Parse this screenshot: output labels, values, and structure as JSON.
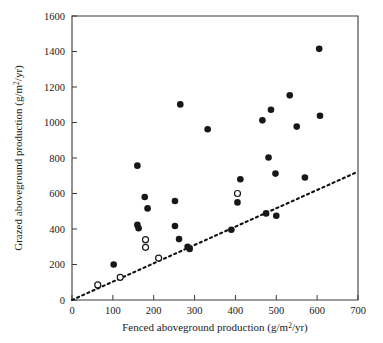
{
  "chart_data": {
    "type": "scatter",
    "title": "",
    "xlabel": "Fenced aboveground production (g/m2/yr)",
    "ylabel": "Grazed aboveground production (g/m2/yr)",
    "xlabel_parts": {
      "pre": "Fenced aboveground production (g/m",
      "sup": "2",
      "post": "/yr)"
    },
    "ylabel_parts": {
      "pre": "Grazed aboveground production (g/m",
      "sup": "2",
      "post": "/yr)"
    },
    "xlim": [
      0,
      700
    ],
    "ylim": [
      0,
      1600
    ],
    "xticks": [
      0,
      100,
      200,
      300,
      400,
      500,
      600,
      700
    ],
    "yticks": [
      0,
      200,
      400,
      600,
      800,
      1000,
      1200,
      1400,
      1600
    ],
    "xtick_labels": [
      "0",
      "100",
      "200",
      "300",
      "400",
      "500",
      "600",
      "700"
    ],
    "ytick_labels": [
      "0",
      "200",
      "400",
      "600",
      "800",
      "1000",
      "1200",
      "1400",
      "1600"
    ],
    "grid": false,
    "legend_position": "none",
    "annotations": [
      {
        "name": "one-to-one-reference-line",
        "type": "dashed-line",
        "description": "Dashed 1:1 reference line from origin",
        "x0": 0,
        "y0": 0,
        "x1": 695,
        "y1": 718
      }
    ],
    "series": [
      {
        "name": "filled",
        "marker": "filled-circle",
        "color": "#171717",
        "points": [
          [
            102,
            200
          ],
          [
            160,
            757
          ],
          [
            160,
            423
          ],
          [
            163,
            404
          ],
          [
            178,
            580
          ],
          [
            185,
            516
          ],
          [
            252,
            558
          ],
          [
            252,
            417
          ],
          [
            262,
            343
          ],
          [
            265,
            1102
          ],
          [
            283,
            300
          ],
          [
            288,
            288
          ],
          [
            332,
            962
          ],
          [
            390,
            396
          ],
          [
            405,
            550
          ],
          [
            412,
            680
          ],
          [
            466,
            1012
          ],
          [
            475,
            488
          ],
          [
            481,
            803
          ],
          [
            487,
            1072
          ],
          [
            498,
            712
          ],
          [
            500,
            475
          ],
          [
            533,
            1153
          ],
          [
            550,
            977
          ],
          [
            570,
            690
          ],
          [
            605,
            1415
          ],
          [
            607,
            1038
          ]
        ]
      },
      {
        "name": "open",
        "marker": "open-circle",
        "color": "#ffffff",
        "points": [
          [
            63,
            85
          ],
          [
            118,
            128
          ],
          [
            180,
            340
          ],
          [
            180,
            297
          ],
          [
            212,
            236
          ],
          [
            405,
            600
          ]
        ]
      }
    ]
  },
  "figure": {
    "background_color": "#ffffff",
    "axis_color": "#3b3b3b",
    "marker_color": "#171717",
    "reference_line_color": "#121212"
  }
}
